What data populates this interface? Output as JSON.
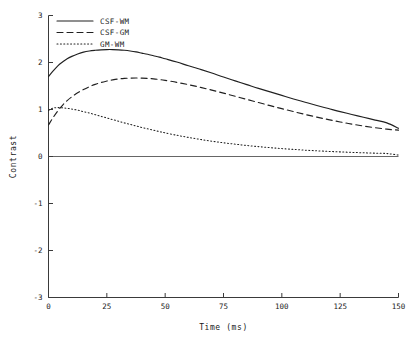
{
  "chart_data": {
    "type": "line",
    "title": "",
    "xlabel": "Time  (ms)",
    "ylabel": "Contrast",
    "xlim": [
      0,
      150
    ],
    "ylim": [
      -3,
      3
    ],
    "grid": false,
    "legend_position": "top-left",
    "xticks": [
      0,
      25,
      50,
      75,
      100,
      125,
      150
    ],
    "xtick_labels": [
      "0",
      "25",
      "50",
      "75",
      "100",
      "125",
      "150"
    ],
    "yticks": [
      3,
      2,
      1,
      0,
      -1,
      -2,
      -3
    ],
    "ytick_labels": [
      "3",
      "2",
      "1",
      "0",
      "-1",
      "-2",
      "-3"
    ],
    "x": [
      0,
      2,
      4,
      6,
      8,
      10,
      12.5,
      15,
      17.5,
      20,
      22.5,
      25,
      27.5,
      30,
      32.5,
      35,
      37.5,
      40,
      42.5,
      45,
      47.5,
      50,
      55,
      60,
      65,
      70,
      75,
      80,
      85,
      90,
      95,
      100,
      105,
      110,
      115,
      120,
      125,
      130,
      135,
      140,
      145,
      150
    ],
    "series": [
      {
        "name": "CSF-WM",
        "style": "solid",
        "values": [
          1.7,
          1.82,
          1.93,
          2.01,
          2.08,
          2.13,
          2.18,
          2.22,
          2.245,
          2.26,
          2.27,
          2.275,
          2.275,
          2.27,
          2.26,
          2.245,
          2.225,
          2.2,
          2.175,
          2.145,
          2.115,
          2.08,
          2.01,
          1.93,
          1.855,
          1.775,
          1.69,
          1.61,
          1.53,
          1.45,
          1.375,
          1.3,
          1.225,
          1.155,
          1.085,
          1.02,
          0.955,
          0.895,
          0.835,
          0.775,
          0.715,
          0.6
        ]
      },
      {
        "name": "CSF-GM",
        "style": "dashed",
        "values": [
          0.67,
          0.83,
          0.97,
          1.09,
          1.19,
          1.27,
          1.355,
          1.425,
          1.485,
          1.535,
          1.575,
          1.605,
          1.63,
          1.65,
          1.662,
          1.668,
          1.67,
          1.668,
          1.662,
          1.652,
          1.638,
          1.62,
          1.578,
          1.528,
          1.472,
          1.412,
          1.348,
          1.282,
          1.215,
          1.148,
          1.082,
          1.018,
          0.955,
          0.895,
          0.838,
          0.785,
          0.735,
          0.69,
          0.648,
          0.612,
          0.582,
          0.56
        ]
      },
      {
        "name": "GM-WM",
        "style": "dotted",
        "values": [
          0.98,
          1.03,
          1.04,
          1.035,
          1.025,
          1.01,
          0.985,
          0.955,
          0.925,
          0.89,
          0.855,
          0.82,
          0.785,
          0.75,
          0.715,
          0.682,
          0.65,
          0.618,
          0.588,
          0.558,
          0.53,
          0.503,
          0.452,
          0.406,
          0.364,
          0.326,
          0.292,
          0.262,
          0.234,
          0.21,
          0.188,
          0.168,
          0.151,
          0.135,
          0.121,
          0.109,
          0.098,
          0.088,
          0.079,
          0.071,
          0.063,
          0.03
        ]
      }
    ]
  },
  "legend": {
    "items": [
      {
        "label": "CSF-WM",
        "style": "solid"
      },
      {
        "label": "CSF-GM",
        "style": "dashed"
      },
      {
        "label": "GM-WM",
        "style": "dotted"
      }
    ]
  }
}
